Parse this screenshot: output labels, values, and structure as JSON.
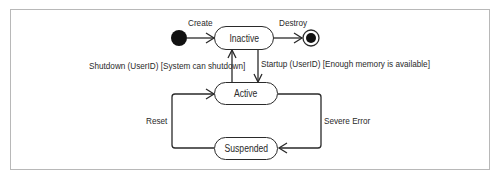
{
  "diagram": {
    "type": "uml-state-machine",
    "colors": {
      "line": "#2a2a2a",
      "frame": "#b8b8b8",
      "background": "#ffffff"
    },
    "states": [
      {
        "id": "inactive",
        "label": "Inactive"
      },
      {
        "id": "active",
        "label": "Active"
      },
      {
        "id": "suspended",
        "label": "Suspended"
      }
    ],
    "pseudostates": [
      {
        "id": "initial",
        "kind": "initial-node"
      },
      {
        "id": "final",
        "kind": "final-node"
      }
    ],
    "transitions": [
      {
        "from": "initial",
        "to": "inactive",
        "label": "Create"
      },
      {
        "from": "inactive",
        "to": "final",
        "label": "Destroy"
      },
      {
        "from": "active",
        "to": "inactive",
        "label": "Shutdown (UserID) [System can shutdown]"
      },
      {
        "from": "inactive",
        "to": "active",
        "label": "Startup (UserID) [Enough memory is available]"
      },
      {
        "from": "suspended",
        "to": "active",
        "label": "Reset"
      },
      {
        "from": "active",
        "to": "suspended",
        "label": "Severe Error"
      }
    ]
  }
}
